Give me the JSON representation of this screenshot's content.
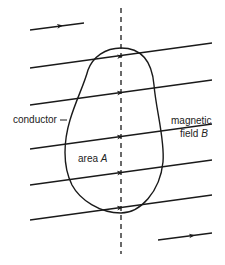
{
  "diagram": {
    "labels": {
      "conductor": "conductor",
      "area_prefix": "area ",
      "area_symbol": "A",
      "field_line1": "magnetic",
      "field_prefix": "field ",
      "field_symbol": "B"
    },
    "colors": {
      "line": "#1a1a1a",
      "background": "#ffffff"
    },
    "elements": {
      "field_lines_count": 5,
      "short_field_arrows": 2,
      "axis": "dashed vertical"
    }
  }
}
